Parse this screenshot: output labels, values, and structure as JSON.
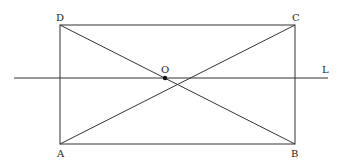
{
  "diagram": {
    "type": "geometry",
    "points": {
      "A": {
        "label": "A",
        "x": 60,
        "y": 144
      },
      "B": {
        "label": "B",
        "x": 295,
        "y": 144
      },
      "C": {
        "label": "C",
        "x": 295,
        "y": 25
      },
      "D": {
        "label": "D",
        "x": 60,
        "y": 25
      },
      "O": {
        "label": "O",
        "x": 165,
        "y": 78
      }
    },
    "line_L": {
      "label": "L",
      "x1": 14,
      "y1": 78,
      "x2": 328,
      "y2": 78
    },
    "colors": {
      "stroke": "#333333",
      "text": "#222222",
      "background": "#ffffff"
    }
  }
}
